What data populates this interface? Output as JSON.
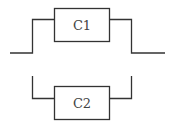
{
  "diagram": {
    "type": "circuit",
    "components": [
      {
        "id": "c1",
        "label": "C1"
      },
      {
        "id": "c2",
        "label": "C2"
      }
    ],
    "colors": {
      "line": "#333333",
      "text": "#444444",
      "background": "#ffffff"
    }
  }
}
